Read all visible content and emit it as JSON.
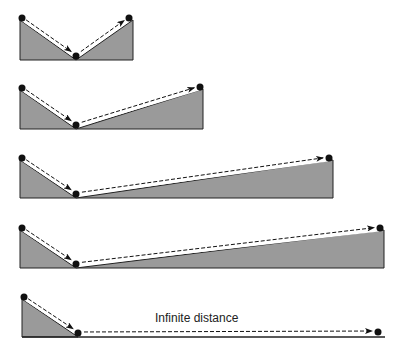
{
  "diagram": {
    "colors": {
      "fill": "#9a9a9a",
      "stroke": "#222222",
      "path_highlight": "#ffffff",
      "dot": "#111111"
    },
    "panels": [
      {
        "id": "panel-1",
        "start": [
          22,
          18
        ],
        "bottom": [
          76,
          56
        ],
        "end": [
          129,
          18
        ],
        "base_y": 60,
        "left_x": 20,
        "right_x": 133
      },
      {
        "id": "panel-2",
        "start": [
          22,
          88
        ],
        "bottom": [
          76,
          125
        ],
        "end": [
          200,
          87
        ],
        "base_y": 129,
        "left_x": 20,
        "right_x": 203
      },
      {
        "id": "panel-3",
        "start": [
          22,
          158
        ],
        "bottom": [
          76,
          194
        ],
        "end": [
          329,
          158
        ],
        "base_y": 198,
        "left_x": 20,
        "right_x": 333
      },
      {
        "id": "panel-4",
        "start": [
          22,
          228
        ],
        "bottom": [
          76,
          264
        ],
        "end": [
          380,
          228
        ],
        "base_y": 268,
        "left_x": 20,
        "right_x": 384
      },
      {
        "id": "panel-5",
        "start": [
          24,
          297
        ],
        "bottom": [
          78,
          333
        ],
        "end": [
          378,
          332
        ],
        "base_y": 337,
        "left_x": 22,
        "right_x": 385,
        "flat": true
      }
    ],
    "annotation": {
      "text": "Infinite distance",
      "x": 155,
      "y": 322
    }
  }
}
